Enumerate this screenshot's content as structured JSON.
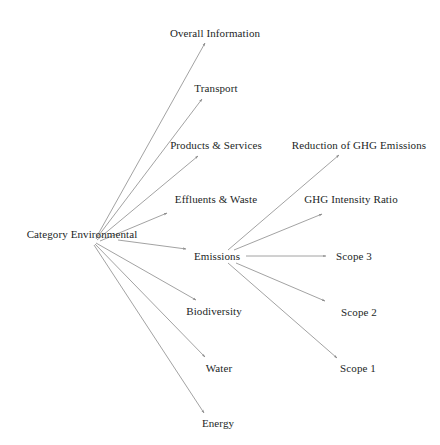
{
  "diagram": {
    "type": "tree-graph",
    "style": {
      "background": "#ffffff",
      "edge_color": "#8a8a8a",
      "text_color": "#231f1f",
      "edge_width": 0.8
    },
    "nodes": [
      {
        "id": "category_environmental",
        "label": "Category Environmental",
        "x": 82,
        "y": 234,
        "anchor": "center"
      },
      {
        "id": "overall_information",
        "label": "Overall Information",
        "x": 215,
        "y": 33,
        "anchor": "center"
      },
      {
        "id": "transport",
        "label": "Transport",
        "x": 216,
        "y": 88,
        "anchor": "center"
      },
      {
        "id": "products_services",
        "label": "Products & Services",
        "x": 216,
        "y": 145,
        "anchor": "center"
      },
      {
        "id": "reduction_ghg_emissions",
        "label": "Reduction of GHG Emissions",
        "x": 359,
        "y": 145,
        "anchor": "center"
      },
      {
        "id": "effluents_waste",
        "label": "Effluents & Waste",
        "x": 216,
        "y": 199,
        "anchor": "center"
      },
      {
        "id": "ghg_intensity_ratio",
        "label": "GHG Intensity Ratio",
        "x": 351,
        "y": 199,
        "anchor": "center"
      },
      {
        "id": "emissions",
        "label": "Emissions",
        "x": 217,
        "y": 256,
        "anchor": "center"
      },
      {
        "id": "scope_3",
        "label": "Scope 3",
        "x": 354,
        "y": 256,
        "anchor": "center"
      },
      {
        "id": "biodiversity",
        "label": "Biodiversity",
        "x": 214,
        "y": 311,
        "anchor": "center"
      },
      {
        "id": "scope_2",
        "label": "Scope 2",
        "x": 359,
        "y": 312,
        "anchor": "center"
      },
      {
        "id": "water",
        "label": "Water",
        "x": 219,
        "y": 368,
        "anchor": "center"
      },
      {
        "id": "scope_1",
        "label": "Scope 1",
        "x": 358,
        "y": 368,
        "anchor": "center"
      },
      {
        "id": "energy",
        "label": "Energy",
        "x": 218,
        "y": 423,
        "anchor": "center"
      }
    ],
    "edges": [
      {
        "from": "category_environmental",
        "to": "overall_information",
        "x1": 96,
        "y1": 238,
        "x2": 205,
        "y2": 43
      },
      {
        "from": "category_environmental",
        "to": "transport",
        "x1": 96,
        "y1": 239,
        "x2": 202,
        "y2": 99
      },
      {
        "from": "category_environmental",
        "to": "products_services",
        "x1": 97,
        "y1": 240,
        "x2": 198,
        "y2": 156
      },
      {
        "from": "category_environmental",
        "to": "effluents_waste",
        "x1": 100,
        "y1": 241,
        "x2": 167,
        "y2": 213
      },
      {
        "from": "category_environmental",
        "to": "emissions",
        "x1": 118,
        "y1": 240,
        "x2": 186,
        "y2": 249
      },
      {
        "from": "category_environmental",
        "to": "biodiversity",
        "x1": 96,
        "y1": 243,
        "x2": 196,
        "y2": 300
      },
      {
        "from": "category_environmental",
        "to": "water",
        "x1": 95,
        "y1": 244,
        "x2": 205,
        "y2": 357
      },
      {
        "from": "category_environmental",
        "to": "energy",
        "x1": 94,
        "y1": 245,
        "x2": 204,
        "y2": 413
      },
      {
        "from": "emissions",
        "to": "reduction_ghg_emissions",
        "x1": 228,
        "y1": 250,
        "x2": 339,
        "y2": 155
      },
      {
        "from": "emissions",
        "to": "ghg_intensity_ratio",
        "x1": 234,
        "y1": 250,
        "x2": 322,
        "y2": 214
      },
      {
        "from": "emissions",
        "to": "scope_3",
        "x1": 246,
        "y1": 256,
        "x2": 326,
        "y2": 256
      },
      {
        "from": "emissions",
        "to": "scope_2",
        "x1": 236,
        "y1": 263,
        "x2": 325,
        "y2": 301
      },
      {
        "from": "emissions",
        "to": "scope_1",
        "x1": 228,
        "y1": 263,
        "x2": 337,
        "y2": 358
      }
    ]
  }
}
